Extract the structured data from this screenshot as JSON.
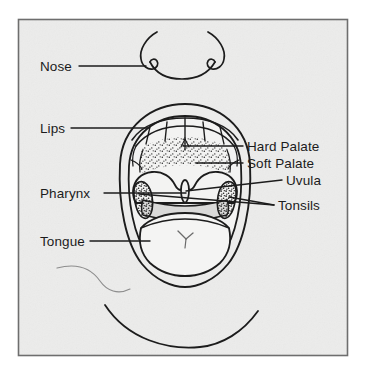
{
  "figure": {
    "kind": "labeled-line-drawing",
    "background_color": "#ececeb",
    "border_color": "#6e6e6e",
    "ink_color": "#1c1c1c",
    "text_color": "#1c1c1c"
  },
  "labels": {
    "nose": "Nose",
    "lips": "Lips",
    "pharynx": "Pharynx",
    "tongue": "Tongue",
    "hard_palate": "Hard Palate",
    "soft_palate": "Soft Palate",
    "uvula": "Uvula",
    "tonsils": "Tonsils"
  },
  "label_list": [
    {
      "key": "nose",
      "text": "Nose",
      "side": "left",
      "x": 40,
      "y": 70
    },
    {
      "key": "lips",
      "text": "Lips",
      "side": "left",
      "x": 40,
      "y": 132
    },
    {
      "key": "pharynx",
      "text": "Pharynx",
      "side": "left",
      "x": 40,
      "y": 197
    },
    {
      "key": "tongue",
      "text": "Tongue",
      "side": "left",
      "x": 40,
      "y": 245
    },
    {
      "key": "hard_palate",
      "text": "Hard Palate",
      "side": "right",
      "x": 246,
      "y": 150
    },
    {
      "key": "soft_palate",
      "text": "Soft Palate",
      "side": "right",
      "x": 246,
      "y": 167
    },
    {
      "key": "uvula",
      "text": "Uvula",
      "side": "right",
      "x": 285,
      "y": 184
    },
    {
      "key": "tonsils",
      "text": "Tonsils",
      "side": "right",
      "x": 277,
      "y": 210
    }
  ],
  "parts": [
    "nose",
    "lips",
    "hard palate",
    "soft palate",
    "uvula",
    "tonsils",
    "pharynx",
    "tongue"
  ]
}
